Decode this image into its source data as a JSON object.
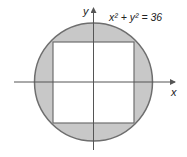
{
  "diagram": {
    "equation": "x² + y² = 36",
    "x_label": "x",
    "y_label": "y",
    "circle": {
      "radius": 6,
      "fill": "#c8c8c8",
      "stroke": "#6e6e6e"
    },
    "square": {
      "description": "inscribed square",
      "fill": "#ffffff",
      "stroke": "#6e6e6e"
    },
    "axis_color": "#555555"
  }
}
